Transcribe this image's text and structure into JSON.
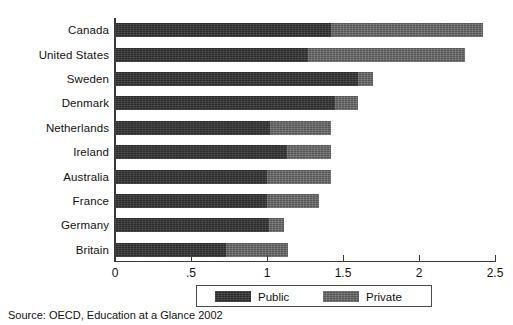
{
  "chart_data": {
    "type": "bar",
    "orientation": "horizontal",
    "stacked": true,
    "title": "",
    "subtitle": "",
    "xlabel": "",
    "ylabel": "",
    "xlim": [
      0,
      2.5
    ],
    "grid": false,
    "categories": [
      "Canada",
      "United States",
      "Sweden",
      "Denmark",
      "Netherlands",
      "Ireland",
      "Australia",
      "France",
      "Germany",
      "Britain"
    ],
    "series": [
      {
        "name": "Public",
        "color": "#2b2b2b",
        "values": [
          1.42,
          1.27,
          1.6,
          1.45,
          1.02,
          1.13,
          1.0,
          1.0,
          1.01,
          0.73
        ]
      },
      {
        "name": "Private",
        "color": "#555555",
        "values": [
          1.0,
          1.03,
          0.1,
          0.15,
          0.4,
          0.29,
          0.42,
          0.34,
          0.1,
          0.41
        ]
      }
    ],
    "totals": [
      2.42,
      2.3,
      1.7,
      1.6,
      1.42,
      1.42,
      1.42,
      1.34,
      1.11,
      1.14
    ],
    "xticks": [
      {
        "value": 0,
        "label": "0"
      },
      {
        "value": 0.5,
        "label": ".5"
      },
      {
        "value": 1,
        "label": "1"
      },
      {
        "value": 1.5,
        "label": "1.5"
      },
      {
        "value": 2,
        "label": "2"
      },
      {
        "value": 2.5,
        "label": "2.5"
      }
    ],
    "legend": {
      "position": "bottom",
      "entries": [
        {
          "label": "Public",
          "color": "#2b2b2b"
        },
        {
          "label": "Private",
          "color": "#555555"
        }
      ]
    },
    "source_note": "Source: OECD, Education at a Glance 2002"
  }
}
